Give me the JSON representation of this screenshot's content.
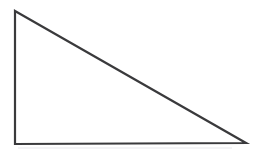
{
  "figure": {
    "name": "right-triangle",
    "background_color": "#ffffff",
    "stroke_color": "#3a3a3c",
    "stroke_width": 2.2,
    "fill": "none",
    "canvas": {
      "width": 260,
      "height": 156
    },
    "vertices": [
      {
        "label": "top-left-apex",
        "x": 15,
        "y": 11
      },
      {
        "label": "bottom-right",
        "x": 246,
        "y": 143
      },
      {
        "label": "bottom-left-right-angle",
        "x": 15,
        "y": 144
      }
    ],
    "edges": [
      {
        "name": "vertical-leg",
        "from": "top-left-apex",
        "to": "bottom-left-right-angle"
      },
      {
        "name": "horizontal-leg",
        "from": "bottom-left-right-angle",
        "to": "bottom-right"
      },
      {
        "name": "hypotenuse",
        "from": "top-left-apex",
        "to": "bottom-right"
      }
    ],
    "polygon_points": "15,11 246,143 15,144",
    "artifact": {
      "name": "scan-shadow-line",
      "color": "#f2f2f4"
    }
  }
}
